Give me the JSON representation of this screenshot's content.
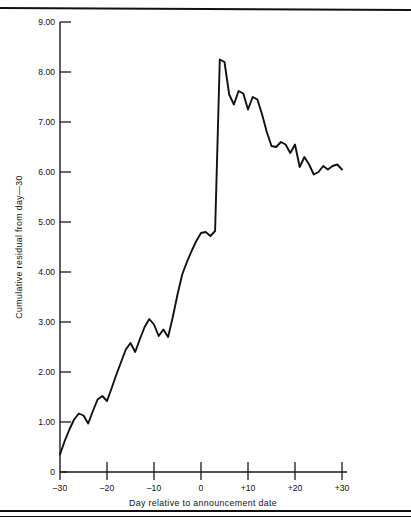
{
  "figure": {
    "background_color": "#ffffff",
    "line_color": "#111111",
    "axis_color": "#1a1a1a"
  },
  "chart_data": {
    "type": "line",
    "title": "",
    "xlabel": "Day relative to announcement date",
    "ylabel": "Cumulative residual from day—30",
    "xlim": [
      -30,
      30
    ],
    "ylim": [
      0,
      9
    ],
    "grid": false,
    "legend": null,
    "xticks": [
      -30,
      -20,
      -10,
      0,
      10,
      20,
      30
    ],
    "xtick_labels": [
      "–30",
      "–20",
      "–10",
      "0",
      "+10",
      "+20",
      "+30"
    ],
    "yticks": [
      0,
      1,
      2,
      3,
      4,
      5,
      6,
      7,
      8,
      9
    ],
    "ytick_labels": [
      "0",
      "1.00",
      "2.00",
      "3.00",
      "4.00",
      "5.00",
      "6.00",
      "7.00",
      "8.00",
      "9.00"
    ],
    "series": [
      {
        "name": "Cumulative residual",
        "x": [
          -30,
          -29,
          -28,
          -27,
          -26,
          -25,
          -24,
          -23,
          -22,
          -21,
          -20,
          -19,
          -18,
          -17,
          -16,
          -15,
          -14,
          -13,
          -12,
          -11,
          -10,
          -9,
          -8,
          -7,
          -6,
          -5,
          -4,
          -3,
          -2,
          -1,
          0,
          1,
          2,
          3,
          4,
          5,
          6,
          7,
          8,
          9,
          10,
          11,
          12,
          13,
          14,
          15,
          16,
          17,
          18,
          19,
          20,
          21,
          22,
          23,
          24,
          25,
          26,
          27,
          28,
          29,
          30
        ],
        "values": [
          0.35,
          0.62,
          0.85,
          1.05,
          1.17,
          1.13,
          0.97,
          1.22,
          1.45,
          1.52,
          1.42,
          1.68,
          1.95,
          2.2,
          2.45,
          2.58,
          2.4,
          2.66,
          2.9,
          3.06,
          2.95,
          2.72,
          2.85,
          2.7,
          3.1,
          3.55,
          3.95,
          4.2,
          4.42,
          4.62,
          4.78,
          4.8,
          4.72,
          4.82,
          8.25,
          8.2,
          7.55,
          7.35,
          7.62,
          7.57,
          7.25,
          7.5,
          7.45,
          7.15,
          6.8,
          6.52,
          6.5,
          6.6,
          6.55,
          6.38,
          6.55,
          6.1,
          6.3,
          6.15,
          5.95,
          6.0,
          6.12,
          6.05,
          6.12,
          6.15,
          6.05
        ]
      }
    ]
  }
}
